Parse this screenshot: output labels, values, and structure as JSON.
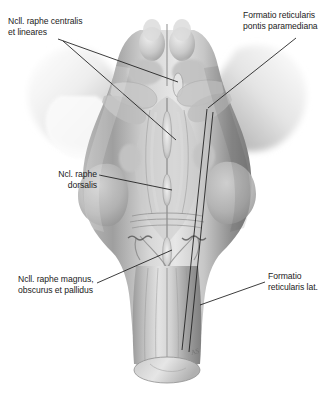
{
  "figure": {
    "view": "posterior (dorsal) aspect of midbrain, pons and medulla oblongata with cerebellar peduncles cut",
    "background_color": "#ffffff",
    "line_color": "#1a1a1a",
    "text_color": "#1b1b1b",
    "artist_mark": "AS"
  },
  "labels": [
    {
      "id": "centralis",
      "lines": [
        "Ncll. raphe centralis",
        "et lineares"
      ],
      "line1": "Ncll. raphe centralis",
      "line2": "et lineares",
      "position": "top-left",
      "leader_target": "midline raphe of rostral pons / midbrain tegmentum"
    },
    {
      "id": "pontis",
      "lines": [
        "Formatio reticularis",
        "pontis paramediana"
      ],
      "line1": "Formatio reticularis",
      "line2": "pontis paramediana",
      "position": "top-right",
      "leader_target": "paramedian pontine reticular formation"
    },
    {
      "id": "dorsalis",
      "lines": [
        "Ncl. raphe",
        "dorsalis"
      ],
      "line1": "Ncl. raphe",
      "line2": "dorsalis",
      "position": "middle-left",
      "leader_target": "dorsal raphe nucleus in midline of upper pons"
    },
    {
      "id": "magnus",
      "lines": [
        "Ncll. raphe magnus,",
        "obscurus et pallidus"
      ],
      "line1": "Ncll. raphe magnus,",
      "line2": "obscurus et pallidus",
      "position": "bottom-left",
      "leader_target": "midline raphe nuclei of the medulla oblongata"
    },
    {
      "id": "lateralis",
      "lines": [
        "Formatio",
        "reticularis lat."
      ],
      "line1": "Formatio",
      "line2": "reticularis lat.",
      "position": "bottom-right",
      "leader_target": "lateral reticular formation of the medulla"
    }
  ],
  "anatomy": {
    "structures": [
      "cerebellar peduncles (cut surfaces)",
      "superior colliculi",
      "inferior colliculi",
      "floor of fourth ventricle (rhomboid fossa)",
      "median sulcus",
      "striae medullares",
      "obex",
      "olive",
      "medulla oblongata",
      "spinal cord (cut end)"
    ]
  }
}
